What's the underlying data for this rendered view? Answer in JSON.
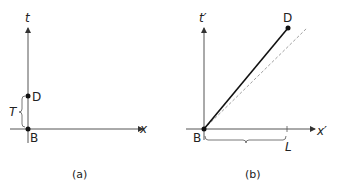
{
  "panel_a": {
    "caption": "(a)",
    "time_axis_label": "t",
    "space_axis_label": "x",
    "event_top": "D",
    "event_origin": "B",
    "interval_label": "T"
  },
  "panel_b": {
    "caption": "(b)",
    "time_axis_label": "t′",
    "space_axis_label": "x′",
    "event_top": "D",
    "event_origin": "B",
    "distance_label": "L"
  },
  "colors": {
    "axis": "#555555",
    "worldline": "#111111",
    "dashed": "#888888"
  }
}
